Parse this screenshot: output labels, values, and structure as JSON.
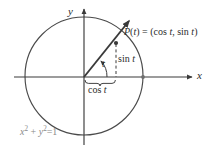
{
  "figure": {
    "background_color": "#ffffff",
    "stroke_color": "#3a3a3a",
    "muted_color": "#8a8a8a",
    "axes": {
      "x_label": "x",
      "y_label": "y",
      "origin": {
        "x": 84,
        "y": 77
      }
    },
    "circle": {
      "center_x": 84,
      "center_y": 76,
      "radius": 59,
      "equation": "x2 + y2 =1",
      "equation_parts": {
        "x_base": "x",
        "x_exp": "2",
        "plus": "+",
        "y_base": "y",
        "y_exp": "2",
        "equals": "=1"
      }
    },
    "point": {
      "label": "P(t) = (cos t, sin t)",
      "label_parts": {
        "p": "P",
        "open_t": "(",
        "t1": "t",
        "close_t": ")",
        "equals": " = (cos ",
        "t2": "t",
        "comma": ", sin ",
        "t3": "t",
        "close": ")"
      },
      "x": 116,
      "y": 43
    },
    "ray": {
      "from_x": 84,
      "from_y": 77,
      "to_x": 130,
      "to_y": 20,
      "arrow": true
    },
    "angle": {
      "label": "t",
      "arc_radius": 22,
      "arrow": true
    },
    "sin_segment": {
      "label": "sin t",
      "label_parts": {
        "fn": "sin ",
        "var": "t"
      },
      "dashed": true
    },
    "cos_segment": {
      "label": "cos t",
      "label_parts": {
        "fn": "cos ",
        "var": "t"
      },
      "brace": true
    }
  }
}
